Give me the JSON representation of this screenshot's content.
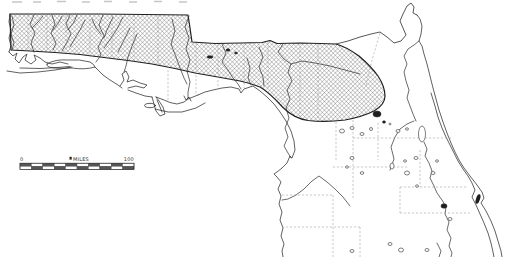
{
  "colors": {
    "background": "#ffffff",
    "ink": "#2b2b2b",
    "hatch_line": "#4a4a4a",
    "county_line": "#9a9a9a",
    "artifact": "#b9b9b9"
  },
  "scale_bar": {
    "start_label": "0",
    "unit_label": "MILES",
    "end_label": "100",
    "divisions": 10
  }
}
